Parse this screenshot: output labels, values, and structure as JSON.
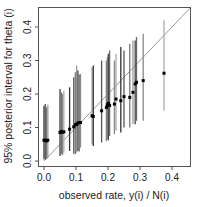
{
  "chart_data": {
    "type": "scatter",
    "title": "",
    "xlabel": "observed rate, y(i) / N(i)",
    "ylabel": "95% posterior interval for theta (i)",
    "xlim": [
      -0.02,
      0.46
    ],
    "ylim": [
      -0.015,
      0.46
    ],
    "xticks": [
      "0.0",
      "0.1",
      "0.2",
      "0.3",
      "0.4"
    ],
    "yticks": [
      "0.0",
      "0.1",
      "0.2",
      "0.3",
      "0.4"
    ],
    "grid": false,
    "reference_line": "y = x",
    "points": [
      {
        "x": 0.0,
        "median": 0.062,
        "low": 0.005,
        "high": 0.165
      },
      {
        "x": 0.004,
        "median": 0.062,
        "low": 0.004,
        "high": 0.17
      },
      {
        "x": 0.008,
        "median": 0.06,
        "low": 0.006,
        "high": 0.16
      },
      {
        "x": 0.012,
        "median": 0.062,
        "low": 0.01,
        "high": 0.168
      },
      {
        "x": 0.05,
        "median": 0.085,
        "low": 0.015,
        "high": 0.215
      },
      {
        "x": 0.054,
        "median": 0.088,
        "low": 0.02,
        "high": 0.205
      },
      {
        "x": 0.058,
        "median": 0.086,
        "low": 0.018,
        "high": 0.2
      },
      {
        "x": 0.062,
        "median": 0.087,
        "low": 0.025,
        "high": 0.21
      },
      {
        "x": 0.08,
        "median": 0.095,
        "low": 0.03,
        "high": 0.22
      },
      {
        "x": 0.093,
        "median": 0.102,
        "low": 0.022,
        "high": 0.25
      },
      {
        "x": 0.098,
        "median": 0.108,
        "low": 0.02,
        "high": 0.265
      },
      {
        "x": 0.102,
        "median": 0.11,
        "low": 0.025,
        "high": 0.285
      },
      {
        "x": 0.106,
        "median": 0.113,
        "low": 0.03,
        "high": 0.27
      },
      {
        "x": 0.11,
        "median": 0.115,
        "low": 0.028,
        "high": 0.258
      },
      {
        "x": 0.114,
        "median": 0.115,
        "low": 0.04,
        "high": 0.26
      },
      {
        "x": 0.15,
        "median": 0.135,
        "low": 0.05,
        "high": 0.28
      },
      {
        "x": 0.154,
        "median": 0.133,
        "low": 0.045,
        "high": 0.285
      },
      {
        "x": 0.18,
        "median": 0.15,
        "low": 0.055,
        "high": 0.3
      },
      {
        "x": 0.195,
        "median": 0.16,
        "low": 0.06,
        "high": 0.3
      },
      {
        "x": 0.198,
        "median": 0.168,
        "low": 0.065,
        "high": 0.31
      },
      {
        "x": 0.201,
        "median": 0.172,
        "low": 0.062,
        "high": 0.32
      },
      {
        "x": 0.205,
        "median": 0.166,
        "low": 0.075,
        "high": 0.33
      },
      {
        "x": 0.22,
        "median": 0.17,
        "low": 0.08,
        "high": 0.3
      },
      {
        "x": 0.225,
        "median": 0.185,
        "low": 0.09,
        "high": 0.32
      },
      {
        "x": 0.24,
        "median": 0.18,
        "low": 0.085,
        "high": 0.34
      },
      {
        "x": 0.25,
        "median": 0.192,
        "low": 0.1,
        "high": 0.33
      },
      {
        "x": 0.268,
        "median": 0.19,
        "low": 0.1,
        "high": 0.35
      },
      {
        "x": 0.278,
        "median": 0.205,
        "low": 0.11,
        "high": 0.36
      },
      {
        "x": 0.285,
        "median": 0.23,
        "low": 0.11,
        "high": 0.36
      },
      {
        "x": 0.289,
        "median": 0.235,
        "low": 0.12,
        "high": 0.37
      },
      {
        "x": 0.31,
        "median": 0.24,
        "low": 0.12,
        "high": 0.38
      },
      {
        "x": 0.375,
        "median": 0.262,
        "low": 0.15,
        "high": 0.42
      }
    ]
  }
}
